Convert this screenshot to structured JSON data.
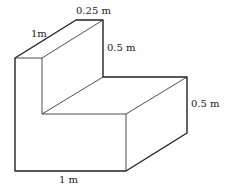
{
  "diagram": {
    "labels": {
      "top_width": "0.25 m",
      "depth": "1m",
      "upper_height": "0.5 m",
      "lower_height": "0.5 m",
      "base_length": "1 m"
    },
    "colors": {
      "stroke": "#222222",
      "background": "#ffffff"
    }
  }
}
